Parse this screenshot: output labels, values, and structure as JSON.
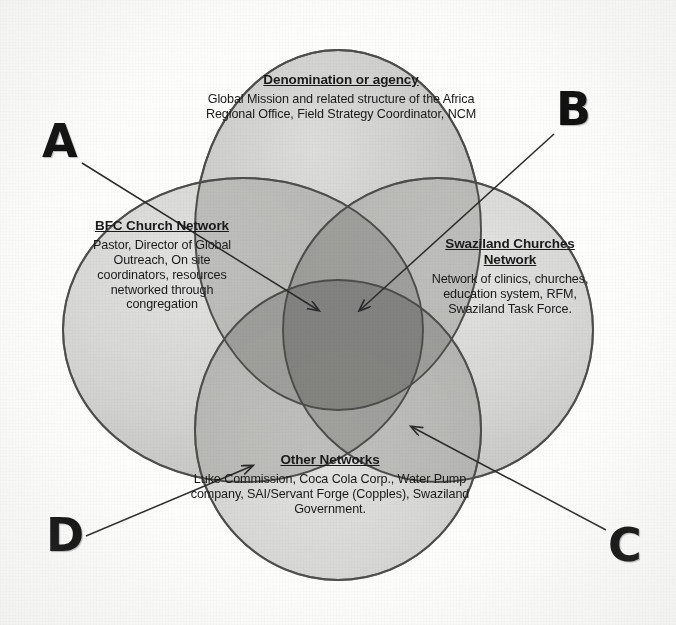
{
  "diagram": {
    "type": "venn",
    "set_count": 4,
    "background_color": "#fdfdfc",
    "circle_fill": "#c9c9c7",
    "circle_stroke": "#4a4a4a",
    "overlap_fill": "#a9a9a7",
    "center_overlap_fill": "#8e8e8c",
    "letter_color": "#0d0d0d",
    "arrow_color": "#2b2b2b"
  },
  "circles": {
    "top": {
      "title": "Denomination or agency",
      "body": "Global Mission and related structure of the Africa Regional Office, Field Strategy Coordinator, NCM"
    },
    "left": {
      "title": "BFC Church Network",
      "body": "Pastor, Director of Global Outreach, On site coordinators, resources networked through congregation"
    },
    "right": {
      "title": "Swaziland Churches Network",
      "body": "Network of clinics, churches, education system, RFM, Swaziland Task Force."
    },
    "bottom": {
      "title": "Other Networks",
      "body": "Luke Commission, Coca Cola Corp., Water Pump company, SAI/Servant Forge (Copples), Swaziland Government."
    }
  },
  "callouts": {
    "a": {
      "letter": "A",
      "target": "center-overlap-left"
    },
    "b": {
      "letter": "B",
      "target": "center-overlap-right"
    },
    "c": {
      "letter": "C",
      "target": "swaziland-other-overlap"
    },
    "d": {
      "letter": "D",
      "target": "bfc-other-overlap"
    }
  }
}
